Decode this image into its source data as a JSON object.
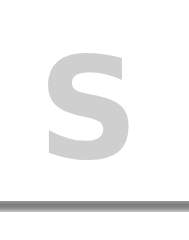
{
  "tile": {
    "letter": "S",
    "letter_color": "#cfcfcf",
    "background": "#ffffff"
  },
  "bottom_bar": {
    "color": "#7a7a7a"
  }
}
